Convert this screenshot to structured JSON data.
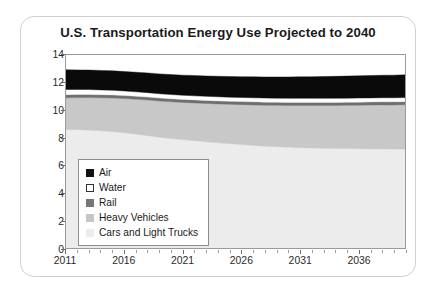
{
  "chart_data": {
    "type": "area",
    "stacked": true,
    "title": "U.S. Transportation Energy Use Projected to 2040",
    "xlabel": "",
    "ylabel": "Millions of Barrels per Day Oil Equivalent",
    "xlim": [
      2011,
      2040
    ],
    "ylim": [
      0,
      14
    ],
    "yticks": [
      0,
      2,
      4,
      6,
      8,
      10,
      12,
      14
    ],
    "xticks": [
      2011,
      2016,
      2021,
      2026,
      2031,
      2036
    ],
    "x_minor_tick_step": 1,
    "grid": false,
    "legend_position": "inside-lower-left",
    "x": [
      2011,
      2012,
      2013,
      2014,
      2015,
      2016,
      2017,
      2018,
      2019,
      2020,
      2021,
      2022,
      2023,
      2024,
      2025,
      2026,
      2027,
      2028,
      2029,
      2030,
      2031,
      2032,
      2033,
      2034,
      2035,
      2036,
      2037,
      2038,
      2039,
      2040
    ],
    "series": [
      {
        "name": "Cars and Light Trucks",
        "color": "#ececec",
        "values": [
          8.6,
          8.58,
          8.55,
          8.5,
          8.44,
          8.36,
          8.26,
          8.15,
          8.04,
          7.94,
          7.86,
          7.78,
          7.7,
          7.63,
          7.56,
          7.5,
          7.44,
          7.39,
          7.35,
          7.31,
          7.28,
          7.26,
          7.24,
          7.22,
          7.21,
          7.2,
          7.19,
          7.19,
          7.18,
          7.18
        ]
      },
      {
        "name": "Heavy Vehicles",
        "color": "#c8c8c8",
        "values": [
          2.3,
          2.33,
          2.36,
          2.4,
          2.44,
          2.48,
          2.53,
          2.58,
          2.62,
          2.66,
          2.7,
          2.74,
          2.78,
          2.82,
          2.86,
          2.9,
          2.94,
          2.97,
          3.0,
          3.03,
          3.06,
          3.08,
          3.1,
          3.12,
          3.14,
          3.16,
          3.18,
          3.19,
          3.2,
          3.21
        ]
      },
      {
        "name": "Rail",
        "color": "#6e6e6e",
        "values": [
          0.22,
          0.22,
          0.22,
          0.22,
          0.22,
          0.22,
          0.22,
          0.22,
          0.22,
          0.22,
          0.22,
          0.22,
          0.22,
          0.22,
          0.22,
          0.22,
          0.22,
          0.22,
          0.22,
          0.22,
          0.22,
          0.22,
          0.22,
          0.22,
          0.22,
          0.22,
          0.22,
          0.22,
          0.22,
          0.22
        ]
      },
      {
        "name": "Water",
        "color": "#ffffff",
        "values": [
          0.38,
          0.37,
          0.36,
          0.35,
          0.34,
          0.33,
          0.32,
          0.32,
          0.31,
          0.31,
          0.3,
          0.3,
          0.3,
          0.3,
          0.3,
          0.3,
          0.3,
          0.3,
          0.3,
          0.3,
          0.3,
          0.3,
          0.3,
          0.3,
          0.3,
          0.3,
          0.3,
          0.3,
          0.3,
          0.3
        ]
      },
      {
        "name": "Air",
        "color": "#0a0a0a",
        "values": [
          1.43,
          1.42,
          1.42,
          1.41,
          1.41,
          1.41,
          1.42,
          1.43,
          1.44,
          1.45,
          1.46,
          1.47,
          1.48,
          1.49,
          1.5,
          1.51,
          1.52,
          1.53,
          1.54,
          1.55,
          1.56,
          1.57,
          1.58,
          1.59,
          1.6,
          1.61,
          1.62,
          1.63,
          1.64,
          1.65
        ]
      }
    ],
    "totals": [
      12.93,
      12.92,
      12.91,
      12.88,
      12.85,
      12.8,
      12.75,
      12.7,
      12.63,
      12.58,
      12.54,
      12.51,
      12.48,
      12.46,
      12.44,
      12.43,
      12.42,
      12.41,
      12.41,
      12.41,
      12.42,
      12.43,
      12.44,
      12.45,
      12.47,
      12.49,
      12.51,
      12.53,
      12.54,
      12.56
    ]
  },
  "legend": {
    "items": [
      {
        "label": "Air",
        "swatch": "#111111",
        "border": "#111111"
      },
      {
        "label": "Water",
        "swatch": "#ffffff",
        "border": "#333333"
      },
      {
        "label": "Rail",
        "swatch": "#767676",
        "border": "#767676"
      },
      {
        "label": "Heavy Vehicles",
        "swatch": "#c6c6c6",
        "border": "#c6c6c6"
      },
      {
        "label": "Cars and Light Trucks",
        "swatch": "#ededed",
        "border": "#ededed"
      }
    ]
  }
}
